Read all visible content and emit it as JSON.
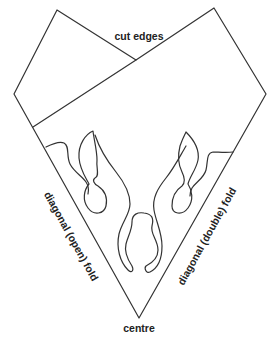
{
  "diagram": {
    "type": "paper-cutting folding template",
    "labels": {
      "cut_edges": "cut edges",
      "left_fold": "diagonal (open) fold",
      "right_fold": "diagonal (double) fold",
      "centre": "centre"
    },
    "colors": {
      "stroke": "#333333",
      "text": "#222222",
      "background": "#ffffff"
    }
  }
}
